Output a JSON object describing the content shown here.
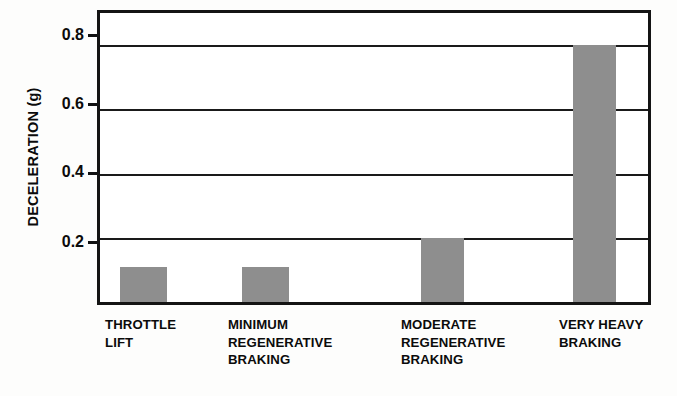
{
  "chart_data": {
    "type": "bar",
    "title": "",
    "xlabel": "",
    "ylabel": "DECELERATION (g)",
    "ylim": [
      0,
      0.9
    ],
    "yticks": [
      0.2,
      0.4,
      0.6,
      0.8
    ],
    "ytick_labels": [
      "0.2",
      "0.4",
      "0.6",
      "0.8"
    ],
    "grid": true,
    "legend": "none",
    "categories": [
      "THROTTLE LIFT",
      "MINIMUM REGENERATIVE BRAKING",
      "MODERATE REGENERATIVE BRAKING",
      "VERY HEAVY BRAKING"
    ],
    "category_lines": [
      [
        "THROTTLE",
        "LIFT"
      ],
      [
        "MINIMUM",
        "REGENERATIVE",
        "BRAKING"
      ],
      [
        "MODERATE",
        "REGENERATIVE",
        "BRAKING"
      ],
      [
        "VERY HEAVY",
        "BRAKING"
      ]
    ],
    "values": [
      0.11,
      0.11,
      0.2,
      0.8
    ],
    "bar_color": "#8e8e8e",
    "axis_color": "#141414",
    "text_color": "#0b0b0b"
  }
}
